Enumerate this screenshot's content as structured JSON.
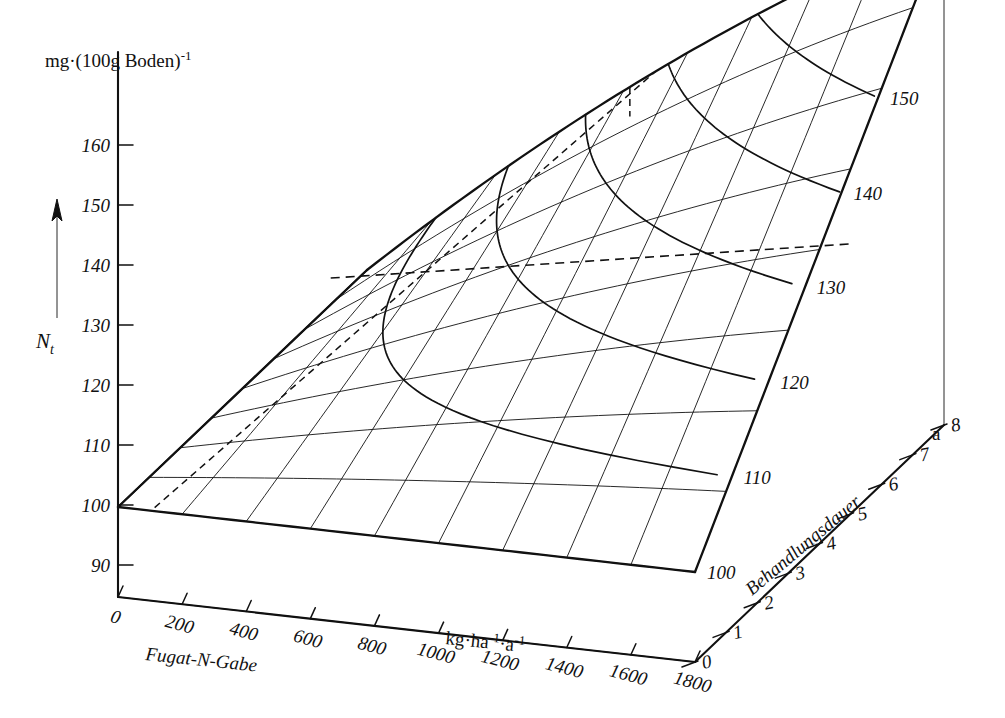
{
  "figure": {
    "background_color": "#ffffff",
    "line_color": "#111111",
    "type": "3d-surface-plot"
  },
  "chart_data": {
    "type": "line",
    "plot_kind": "3d-surface-mesh-with-contours",
    "title": "",
    "zlabel_unit": "mg·(100g Boden)",
    "zlabel_unit_exponent": "-1",
    "zlabel_symbol": "N",
    "zlabel_symbol_sub": "t",
    "xlabel": "Fugat-N-Gabe",
    "xlabel_unit": "kg·ha",
    "xlabel_unit_exp1": "-1",
    "xlabel_unit_mid": "·a",
    "xlabel_unit_exp2": "-1",
    "ylabel": "Behandlungsdauer",
    "ylabel_unit": "a",
    "xticks": [
      0,
      200,
      400,
      600,
      800,
      1000,
      1200,
      1400,
      1600,
      1800
    ],
    "xlim": [
      0,
      1800
    ],
    "yticks": [
      0,
      1,
      2,
      3,
      4,
      5,
      6,
      7,
      8
    ],
    "ylim": [
      0,
      8
    ],
    "zticks": [
      90,
      100,
      110,
      120,
      130,
      140,
      150,
      160
    ],
    "zlim": [
      85,
      168
    ],
    "contour_levels": [
      100,
      110,
      120,
      130,
      140,
      150
    ],
    "contour_label_side": "right",
    "grid": false,
    "legend": false,
    "surface_origin_value": 100,
    "surface_apex_value": 168,
    "dashed_contour_level": 130,
    "notes_visible": "",
    "series": [
      {
        "name": "Behandlungsdauer 0 a",
        "x": [
          0,
          200,
          400,
          600,
          800,
          1000,
          1200,
          1400,
          1600,
          1800
        ],
        "values": [
          100,
          100,
          100,
          100,
          100,
          100,
          100,
          100,
          100,
          100
        ]
      },
      {
        "name": "Behandlungsdauer 1 a",
        "x": [
          0,
          200,
          400,
          600,
          800,
          1000,
          1200,
          1400,
          1600,
          1800
        ],
        "values": [
          100,
          101,
          102,
          103,
          104,
          105,
          106,
          107,
          108,
          109
        ]
      },
      {
        "name": "Behandlungsdauer 2 a",
        "x": [
          0,
          200,
          400,
          600,
          800,
          1000,
          1200,
          1400,
          1600,
          1800
        ],
        "values": [
          100,
          102,
          104,
          106,
          108,
          110,
          112,
          114,
          116,
          118
        ]
      },
      {
        "name": "Behandlungsdauer 3 a",
        "x": [
          0,
          200,
          400,
          600,
          800,
          1000,
          1200,
          1400,
          1600,
          1800
        ],
        "values": [
          100,
          103,
          106,
          109,
          112,
          115,
          118,
          121,
          124,
          127
        ]
      },
      {
        "name": "Behandlungsdauer 4 a",
        "x": [
          0,
          200,
          400,
          600,
          800,
          1000,
          1200,
          1400,
          1600,
          1800
        ],
        "values": [
          100,
          104,
          108,
          112,
          116,
          120,
          124,
          128,
          132,
          136
        ]
      },
      {
        "name": "Behandlungsdauer 5 a",
        "x": [
          0,
          200,
          400,
          600,
          800,
          1000,
          1200,
          1400,
          1600,
          1800
        ],
        "values": [
          100,
          105,
          110,
          115,
          120,
          125,
          130,
          135,
          140,
          145
        ]
      },
      {
        "name": "Behandlungsdauer 6 a",
        "x": [
          0,
          200,
          400,
          600,
          800,
          1000,
          1200,
          1400,
          1600,
          1800
        ],
        "values": [
          100,
          106,
          112,
          118,
          124,
          130,
          136,
          142,
          148,
          154
        ]
      },
      {
        "name": "Behandlungsdauer 7 a",
        "x": [
          0,
          200,
          400,
          600,
          800,
          1000,
          1200,
          1400,
          1600,
          1800
        ],
        "values": [
          100,
          107,
          114,
          121,
          128,
          135,
          142,
          149,
          156,
          163
        ]
      },
      {
        "name": "Behandlungsdauer 8 a",
        "x": [
          0,
          200,
          400,
          600,
          800,
          1000,
          1200,
          1400,
          1600,
          1800
        ],
        "values": [
          100,
          108,
          116,
          124,
          132,
          140,
          148,
          156,
          164,
          168
        ]
      }
    ]
  },
  "axes": {
    "z_axis": {
      "name": "N_t vertical axis",
      "unit_label": "mg·(100g Boden)",
      "unit_exponent": "-1",
      "symbol": "N",
      "symbol_sub": "t",
      "ticks": [
        "90",
        "100",
        "110",
        "120",
        "130",
        "140",
        "150",
        "160"
      ]
    },
    "x_axis": {
      "name": "Fugat-N-Gabe",
      "label": "Fugat-N-Gabe",
      "unit": "kg·ha",
      "unit_exp1": "-1",
      "unit_mid": "·a",
      "unit_exp2": "-1",
      "ticks": [
        "0",
        "200",
        "400",
        "600",
        "800",
        "1000",
        "1200",
        "1400",
        "1600",
        "1800"
      ]
    },
    "y_axis": {
      "name": "Behandlungsdauer",
      "label": "Behandlungsdauer",
      "unit": "a",
      "ticks": [
        "0",
        "1",
        "2",
        "3",
        "4",
        "5",
        "6",
        "7",
        "8"
      ]
    }
  },
  "contour_labels": [
    "100",
    "110",
    "120",
    "130",
    "140",
    "150"
  ]
}
